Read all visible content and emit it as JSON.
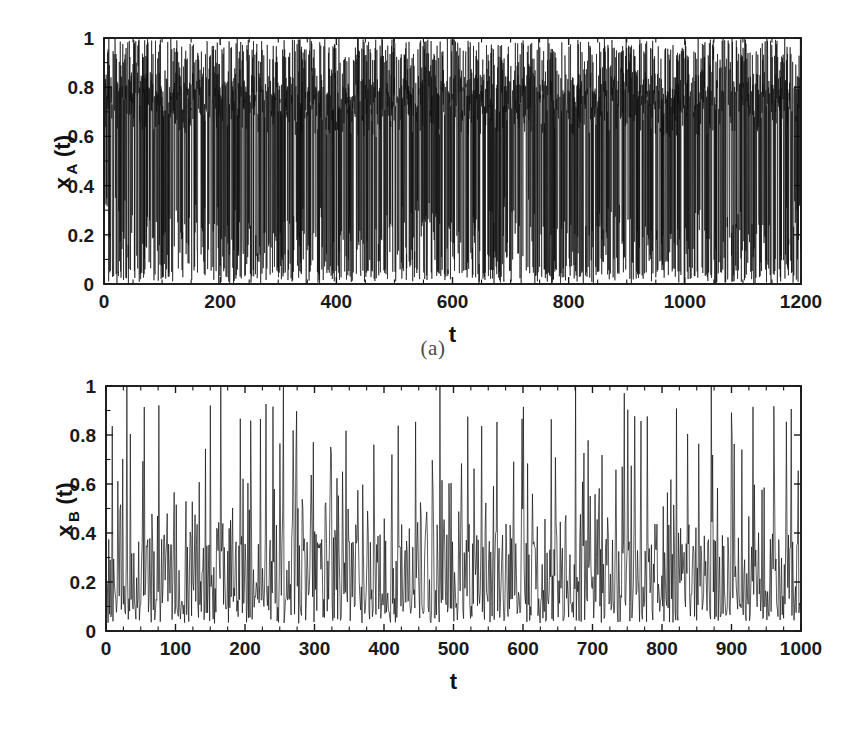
{
  "figure": {
    "background_color": "#ffffff",
    "line_color": "#0d0d0d",
    "axis_color": "#1a1a1a"
  },
  "panels": [
    {
      "id": "a",
      "caption": "(a)",
      "ylabel_main": "x",
      "ylabel_sub": "A",
      "ylabel_tail": "(t)",
      "xlabel": "t",
      "xticks": [
        "0",
        "200",
        "400",
        "600",
        "800",
        "1000",
        "1200"
      ],
      "yticks": [
        "0",
        "0.2",
        "0.4",
        "0.6",
        "0.8",
        "1"
      ]
    },
    {
      "id": "b",
      "caption": "(b)",
      "ylabel_main": "x",
      "ylabel_sub": "B",
      "ylabel_tail": "(t)",
      "xlabel": "t",
      "xticks": [
        "0",
        "100",
        "200",
        "300",
        "400",
        "500",
        "600",
        "700",
        "800",
        "900",
        "1000"
      ],
      "yticks": [
        "0",
        "0.2",
        "0.4",
        "0.6",
        "0.8",
        "1"
      ]
    }
  ],
  "chart_data": [
    {
      "type": "line",
      "title": "(a)",
      "xlabel": "t",
      "ylabel": "x_A(t)",
      "xlim": [
        0,
        1200
      ],
      "ylim": [
        0,
        1
      ],
      "xticks": [
        0,
        200,
        400,
        600,
        800,
        1000,
        1200
      ],
      "yticks": [
        0,
        0.2,
        0.4,
        0.6,
        0.8,
        1
      ],
      "xtick_minor_step": 50,
      "grid": false,
      "legend": null,
      "series_name": "x_A(t)",
      "n_points": 1200,
      "description": "Densely oscillating chaotic time series spanning the full 0 to 1 range. Dominant band of activity between 0.55 and 0.85 with frequent full-amplitude excursions down to 0 and up to 1. Oscillation period is of order 2 to 4 time units producing a nearly solid black band across the whole axis.",
      "value_range": [
        0.0,
        1.0
      ],
      "dominant_band": [
        0.55,
        0.85
      ],
      "mean_estimate": 0.63,
      "seed": 20174,
      "generator": "chaotic-dense"
    },
    {
      "type": "line",
      "title": "(b)",
      "xlabel": "t",
      "ylabel": "x_B(t)",
      "xlim": [
        0,
        1000
      ],
      "ylim": [
        0,
        1
      ],
      "xticks": [
        0,
        100,
        200,
        300,
        400,
        500,
        600,
        700,
        800,
        900,
        1000
      ],
      "yticks": [
        0,
        0.2,
        0.4,
        0.6,
        0.8,
        1
      ],
      "xtick_minor_step": 25,
      "grid": false,
      "legend": null,
      "series_name": "x_B(t)",
      "n_points": 1000,
      "description": "Intermittent spiky time series. Baseline activity concentrated between 0.05 and 0.30 with sparse tall bursts reaching 0.6 to 1.0. Several spikes saturate at the top of the axis near t = 30, 55, 150, 165, 230, 240, 255, 345, 640, 675, 820 and 870.",
      "value_range": [
        0.0,
        1.0
      ],
      "baseline_band": [
        0.05,
        0.3
      ],
      "spike_band": [
        0.6,
        1.0
      ],
      "mean_estimate": 0.22,
      "seed": 90553,
      "generator": "intermittent-spiky",
      "notable_spike_times": [
        30,
        55,
        150,
        165,
        230,
        240,
        255,
        345,
        420,
        480,
        520,
        640,
        675,
        745,
        820,
        870,
        930,
        985
      ]
    }
  ]
}
